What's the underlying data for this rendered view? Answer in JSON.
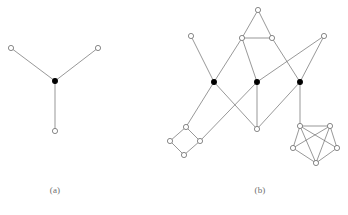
{
  "figure": {
    "width": 348,
    "height": 215,
    "background": "#ffffff",
    "edge_color": "#6b6b6b",
    "edge_width": 0.7,
    "node_stroke": "#6b6b6b",
    "node_open_fill": "#ffffff",
    "node_filled_fill": "#000000",
    "node_radius_open": 2.6,
    "node_radius_filled": 2.4,
    "captions": [
      {
        "id": "caption-a",
        "label": "(a)"
      },
      {
        "id": "caption-b",
        "label": "(b)"
      }
    ]
  },
  "chart_data": {
    "type": "diagram",
    "subtype": "graph-node-link",
    "title": "",
    "panels": [
      {
        "id": "panel-a",
        "caption": "(a)",
        "description": "star K1,3 with one filled center vertex and three open leaf vertices",
        "node_count": 4,
        "edge_count": 3,
        "nodes": [
          {
            "id": "a0",
            "x": 11,
            "y": 48,
            "style": "open"
          },
          {
            "id": "a1",
            "x": 98,
            "y": 48,
            "style": "open"
          },
          {
            "id": "a2",
            "x": 55,
            "y": 81,
            "style": "filled"
          },
          {
            "id": "a3",
            "x": 55,
            "y": 131,
            "style": "open"
          }
        ],
        "edges": [
          {
            "from": "a0",
            "to": "a2"
          },
          {
            "from": "a1",
            "to": "a2"
          },
          {
            "from": "a2",
            "to": "a3"
          }
        ]
      },
      {
        "id": "panel-b",
        "caption": "(b)",
        "description": "larger graph: three filled vertices in a row, a top triangle, a lower-left 4-cycle and a lower-right 5-vertex cluster, joined by crossing edges",
        "node_count": 17,
        "edge_count": 28,
        "nodes": [
          {
            "id": "t0",
            "x": 258,
            "y": 10,
            "style": "open"
          },
          {
            "id": "t1",
            "x": 242,
            "y": 38,
            "style": "open"
          },
          {
            "id": "t2",
            "x": 272,
            "y": 38,
            "style": "open"
          },
          {
            "id": "l0",
            "x": 191,
            "y": 36,
            "style": "open"
          },
          {
            "id": "r0",
            "x": 324,
            "y": 36,
            "style": "open"
          },
          {
            "id": "b1",
            "x": 214,
            "y": 82,
            "style": "filled"
          },
          {
            "id": "b2",
            "x": 257,
            "y": 82,
            "style": "filled"
          },
          {
            "id": "b3",
            "x": 300,
            "y": 82,
            "style": "filled"
          },
          {
            "id": "m0",
            "x": 257,
            "y": 129,
            "style": "open"
          },
          {
            "id": "q0",
            "x": 186,
            "y": 127,
            "style": "open"
          },
          {
            "id": "q1",
            "x": 170,
            "y": 141,
            "style": "open"
          },
          {
            "id": "q2",
            "x": 200,
            "y": 141,
            "style": "open"
          },
          {
            "id": "q3",
            "x": 184,
            "y": 155,
            "style": "open"
          },
          {
            "id": "p0",
            "x": 300,
            "y": 126,
            "style": "open"
          },
          {
            "id": "p1",
            "x": 330,
            "y": 126,
            "style": "open"
          },
          {
            "id": "p2",
            "x": 293,
            "y": 148,
            "style": "open"
          },
          {
            "id": "p3",
            "x": 337,
            "y": 148,
            "style": "open"
          },
          {
            "id": "p4",
            "x": 316,
            "y": 163,
            "style": "open"
          }
        ],
        "edges": [
          {
            "from": "t0",
            "to": "t1"
          },
          {
            "from": "t0",
            "to": "t2"
          },
          {
            "from": "t1",
            "to": "t2"
          },
          {
            "from": "t1",
            "to": "b1"
          },
          {
            "from": "t1",
            "to": "b2"
          },
          {
            "from": "t2",
            "to": "b3"
          },
          {
            "from": "l0",
            "to": "b1"
          },
          {
            "from": "r0",
            "to": "b3"
          },
          {
            "from": "r0",
            "to": "b2"
          },
          {
            "from": "b1",
            "to": "q0"
          },
          {
            "from": "b1",
            "to": "m0"
          },
          {
            "from": "b2",
            "to": "m0"
          },
          {
            "from": "b2",
            "to": "q2"
          },
          {
            "from": "b3",
            "to": "m0"
          },
          {
            "from": "b3",
            "to": "p0"
          },
          {
            "from": "q0",
            "to": "q1"
          },
          {
            "from": "q0",
            "to": "q2"
          },
          {
            "from": "q1",
            "to": "q3"
          },
          {
            "from": "q2",
            "to": "q3"
          },
          {
            "from": "p0",
            "to": "p1"
          },
          {
            "from": "p0",
            "to": "p2"
          },
          {
            "from": "p0",
            "to": "p3"
          },
          {
            "from": "p0",
            "to": "p4"
          },
          {
            "from": "p1",
            "to": "p2"
          },
          {
            "from": "p1",
            "to": "p3"
          },
          {
            "from": "p1",
            "to": "p4"
          },
          {
            "from": "p2",
            "to": "p4"
          },
          {
            "from": "p3",
            "to": "p4"
          }
        ]
      }
    ]
  }
}
